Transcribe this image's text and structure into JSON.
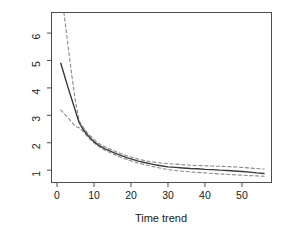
{
  "chart_data": {
    "type": "line",
    "title": "",
    "xlabel": "Time trend",
    "ylabel": "Returns to scale",
    "xlim": [
      -1.5,
      58
    ],
    "ylim": [
      0.55,
      6.75
    ],
    "xticks": [
      0,
      10,
      20,
      30,
      40,
      50
    ],
    "xtick_labels": [
      "0",
      "10",
      "20",
      "30",
      "40",
      "50"
    ],
    "yticks": [
      1,
      2,
      3,
      4,
      5,
      6
    ],
    "ytick_labels": [
      "1",
      "2",
      "3",
      "4",
      "5",
      "6"
    ],
    "grid": false,
    "legend": null,
    "box": "L-shaped axes with full frame",
    "series": [
      {
        "name": "Returns to scale (estimate)",
        "style": "solid",
        "color": "#3a3a3a",
        "width": 1.4,
        "x": [
          1,
          2,
          3,
          4,
          5,
          6,
          7,
          8,
          9,
          10,
          11,
          12,
          13,
          14,
          15,
          16,
          17,
          18,
          19,
          20,
          22,
          24,
          26,
          28,
          30,
          32,
          34,
          36,
          38,
          40,
          42,
          44,
          46,
          48,
          50,
          52,
          54,
          56
        ],
        "y": [
          4.9,
          4.45,
          4.0,
          3.58,
          3.15,
          2.72,
          2.5,
          2.32,
          2.17,
          2.04,
          1.93,
          1.85,
          1.78,
          1.72,
          1.66,
          1.6,
          1.55,
          1.5,
          1.45,
          1.41,
          1.33,
          1.27,
          1.21,
          1.16,
          1.12,
          1.1,
          1.08,
          1.06,
          1.05,
          1.03,
          1.02,
          1.0,
          0.99,
          0.97,
          0.95,
          0.93,
          0.9,
          0.88
        ]
      },
      {
        "name": "Upper confidence band",
        "style": "dashed",
        "color": "#8a8a8a",
        "width": 1.1,
        "x": [
          1,
          2,
          3,
          4,
          5,
          6,
          7,
          8,
          9,
          10,
          11,
          12,
          13,
          14,
          15,
          16,
          17,
          18,
          19,
          20,
          22,
          24,
          26,
          28,
          30,
          32,
          34,
          36,
          38,
          40,
          42,
          44,
          46,
          48,
          50,
          52,
          54,
          56
        ],
        "y": [
          7.6,
          6.6,
          5.5,
          4.45,
          3.5,
          2.8,
          2.58,
          2.4,
          2.25,
          2.12,
          2.0,
          1.92,
          1.85,
          1.79,
          1.73,
          1.67,
          1.62,
          1.57,
          1.52,
          1.48,
          1.4,
          1.34,
          1.3,
          1.26,
          1.24,
          1.22,
          1.2,
          1.18,
          1.17,
          1.16,
          1.15,
          1.14,
          1.13,
          1.12,
          1.1,
          1.08,
          1.06,
          1.04
        ]
      },
      {
        "name": "Lower confidence band",
        "style": "dashed",
        "color": "#8a8a8a",
        "width": 1.1,
        "x": [
          1,
          2,
          3,
          4,
          5,
          6,
          7,
          8,
          9,
          10,
          11,
          12,
          13,
          14,
          15,
          16,
          17,
          18,
          19,
          20,
          22,
          24,
          26,
          28,
          30,
          32,
          34,
          36,
          38,
          40,
          42,
          44,
          46,
          48,
          50,
          52,
          54,
          56
        ],
        "y": [
          3.2,
          3.05,
          2.9,
          2.75,
          2.6,
          2.55,
          2.42,
          2.26,
          2.12,
          2.0,
          1.89,
          1.8,
          1.73,
          1.66,
          1.6,
          1.54,
          1.48,
          1.43,
          1.38,
          1.34,
          1.26,
          1.19,
          1.13,
          1.07,
          1.02,
          0.99,
          0.96,
          0.94,
          0.92,
          0.9,
          0.88,
          0.86,
          0.85,
          0.83,
          0.82,
          0.8,
          0.79,
          0.78
        ]
      }
    ]
  },
  "colors": {
    "axis": "#4d4d4d",
    "text": "#1a1a1a",
    "line": "#3a3a3a",
    "band": "#8a8a8a",
    "background": "#ffffff"
  }
}
